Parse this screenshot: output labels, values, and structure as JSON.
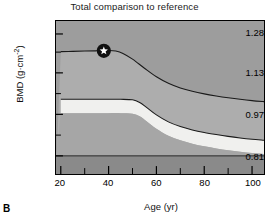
{
  "panel": {
    "letter": "B"
  },
  "chart_data": {
    "type": "area",
    "title": "Total comparison to reference",
    "xlabel": "Age (yr)",
    "ylabel": "BMD (g·cm⁻²)",
    "ylabel_text": "BMD (g·cm",
    "ylabel_sup": "-2",
    "ylabel_tail": ")",
    "xlim": [
      18,
      105
    ],
    "ylim": [
      0.74,
      1.33
    ],
    "grid": false,
    "legend": null,
    "xticks": [
      20,
      40,
      60,
      80,
      100
    ],
    "xtick_labels": [
      "20",
      "40",
      "60",
      "80",
      "100"
    ],
    "xminor_ticks": [
      30,
      50,
      70,
      90
    ],
    "yticks": [
      0.81,
      0.97,
      1.13,
      1.28
    ],
    "ytick_labels": [
      "0.81",
      "0.97",
      "1.13",
      "1.28"
    ],
    "yminor_ticks": [
      0.89,
      1.05,
      1.21
    ],
    "bands": [
      {
        "name": "above-plus-2sd",
        "fill": "#9d9d9d",
        "from": 1.33,
        "to": "curve_plus2sd"
      },
      {
        "name": "reference-upper",
        "fill": "#adadad",
        "from": "curve_plus2sd",
        "to": "curve_mean"
      },
      {
        "name": "reference-mean-band",
        "fill": "#f0f0ee",
        "from": "curve_mean",
        "to": "curve_minus2sd"
      },
      {
        "name": "below-minus-2sd",
        "fill": "#a6a6a6",
        "from": "curve_minus2sd",
        "to": 0.81
      },
      {
        "name": "osteoporosis-zone",
        "fill": "#8a8a8a",
        "from": 0.81,
        "to": 0.74
      }
    ],
    "series": [
      {
        "name": "reference-upper-curve",
        "type": "line",
        "color": "#1a1a1a",
        "x": [
          20,
          25,
          30,
          35,
          40,
          43,
          46,
          50,
          55,
          60,
          65,
          70,
          75,
          80,
          85,
          90,
          95,
          100,
          105
        ],
        "y": [
          1.212,
          1.213,
          1.214,
          1.215,
          1.216,
          1.214,
          1.205,
          1.183,
          1.148,
          1.115,
          1.09,
          1.072,
          1.059,
          1.049,
          1.041,
          1.034,
          1.028,
          1.023,
          1.019
        ]
      },
      {
        "name": "reference-mean-curve",
        "type": "line",
        "color": "#1a1a1a",
        "x": [
          20,
          25,
          30,
          35,
          40,
          45,
          50,
          53,
          56,
          60,
          65,
          70,
          75,
          80,
          85,
          90,
          95,
          100,
          105
        ],
        "y": [
          1.028,
          1.028,
          1.028,
          1.028,
          1.028,
          1.028,
          1.026,
          1.016,
          0.996,
          0.968,
          0.941,
          0.923,
          0.91,
          0.9,
          0.892,
          0.885,
          0.879,
          0.874,
          0.87
        ]
      }
    ],
    "markers": [
      {
        "name": "patient-measurement",
        "symbol": "star-in-circle",
        "x": 38,
        "y": 1.215,
        "circle_color": "#111111",
        "star_color": "#ffffff"
      }
    ]
  }
}
